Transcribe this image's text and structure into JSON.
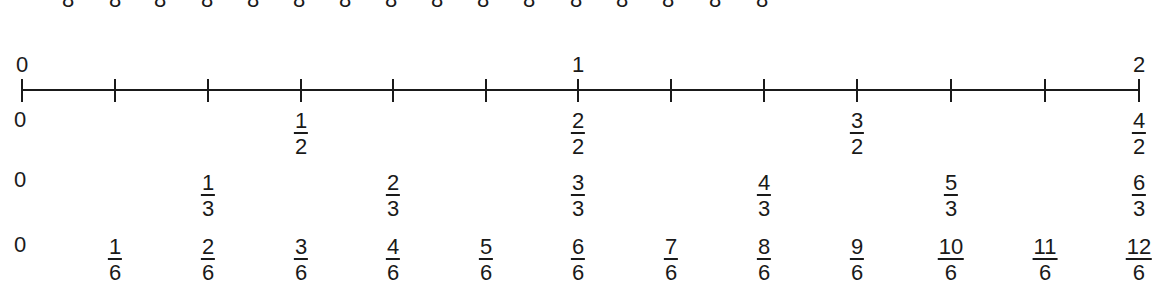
{
  "top_cutoff_row": {
    "denominators": [
      "8",
      "8",
      "8",
      "8",
      "8",
      "8",
      "8",
      "8",
      "8",
      "8",
      "8",
      "8",
      "8",
      "8",
      "8",
      "8"
    ],
    "x_positions": [
      68,
      115,
      160,
      207,
      253,
      299,
      345,
      391,
      437,
      483,
      529,
      576,
      622,
      668,
      715,
      762
    ]
  },
  "number_line": {
    "start_label": "0",
    "mid_label": "1",
    "end_label": "2",
    "tick_count": 13,
    "tick_x": [
      22,
      115,
      208,
      301,
      393,
      486,
      578,
      671,
      764,
      857,
      951,
      1045,
      1139
    ]
  },
  "rows": {
    "halves": {
      "zero": "0",
      "fractions": [
        {
          "num": "1",
          "den": "2",
          "x": 301
        },
        {
          "num": "2",
          "den": "2",
          "x": 578
        },
        {
          "num": "3",
          "den": "2",
          "x": 857
        },
        {
          "num": "4",
          "den": "2",
          "x": 1139
        }
      ]
    },
    "thirds": {
      "zero": "0",
      "fractions": [
        {
          "num": "1",
          "den": "3",
          "x": 208
        },
        {
          "num": "2",
          "den": "3",
          "x": 393
        },
        {
          "num": "3",
          "den": "3",
          "x": 578
        },
        {
          "num": "4",
          "den": "3",
          "x": 764
        },
        {
          "num": "5",
          "den": "3",
          "x": 951
        },
        {
          "num": "6",
          "den": "3",
          "x": 1139
        }
      ]
    },
    "sixths": {
      "zero": "0",
      "fractions": [
        {
          "num": "1",
          "den": "6",
          "x": 115
        },
        {
          "num": "2",
          "den": "6",
          "x": 208
        },
        {
          "num": "3",
          "den": "6",
          "x": 301
        },
        {
          "num": "4",
          "den": "6",
          "x": 393
        },
        {
          "num": "5",
          "den": "6",
          "x": 486
        },
        {
          "num": "6",
          "den": "6",
          "x": 578
        },
        {
          "num": "7",
          "den": "6",
          "x": 671
        },
        {
          "num": "8",
          "den": "6",
          "x": 764
        },
        {
          "num": "9",
          "den": "6",
          "x": 857
        },
        {
          "num": "10",
          "den": "6",
          "x": 951
        },
        {
          "num": "11",
          "den": "6",
          "x": 1045
        },
        {
          "num": "12",
          "den": "6",
          "x": 1139
        }
      ]
    }
  }
}
